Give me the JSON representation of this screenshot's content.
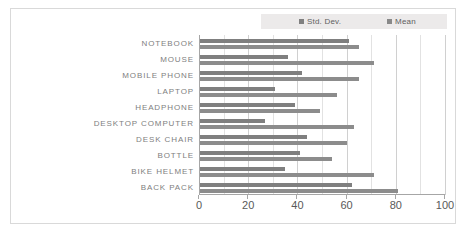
{
  "chart_data": {
    "type": "bar",
    "orientation": "horizontal",
    "title": "",
    "xlabel": "",
    "ylabel": "",
    "xlim": [
      0,
      100
    ],
    "xticks": [
      0,
      20,
      40,
      60,
      80,
      100
    ],
    "minor_gridlines": true,
    "legend_position": "top-right",
    "categories": [
      "NOTEBOOK",
      "MOUSE",
      "MOBILE PHONE",
      "LAPTOP",
      "HEADPHONE",
      "DESKTOP COMPUTER",
      "DESK CHAIR",
      "BOTTLE",
      "BIKE HELMET",
      "BACK PACK"
    ],
    "series": [
      {
        "name": "Std. Dev.",
        "color": "#7f7f7f",
        "values": [
          61,
          36,
          42,
          31,
          39,
          27,
          44,
          41,
          35,
          62
        ]
      },
      {
        "name": "Mean",
        "color": "#8c8c8c",
        "values": [
          65,
          71,
          65,
          56,
          49,
          63,
          60,
          54,
          71,
          81
        ]
      }
    ],
    "extra_values": {
      "note": "two bars per category; upper = Std. Dev., lower = Mean"
    }
  },
  "legend": {
    "entries": [
      {
        "label": "Std. Dev.",
        "color": "#808080"
      },
      {
        "label": "Mean",
        "color": "#898989"
      }
    ]
  },
  "colors": {
    "frame_border": "#d9d9d9",
    "gridline": "#d0d0d0",
    "axis": "#a6a6a6",
    "label_text": "#808080",
    "tick_text": "#595959",
    "legend_bg": "#eceaea"
  }
}
